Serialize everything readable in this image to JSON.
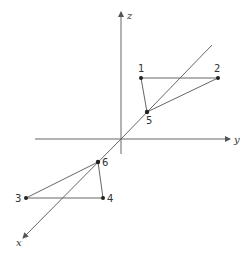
{
  "diagram": {
    "type": "3d-axes-points",
    "axes": [
      {
        "name": "x",
        "label": "x"
      },
      {
        "name": "y",
        "label": "y"
      },
      {
        "name": "z",
        "label": "z"
      }
    ],
    "points": [
      {
        "id": "1",
        "label": "1"
      },
      {
        "id": "2",
        "label": "2"
      },
      {
        "id": "3",
        "label": "3"
      },
      {
        "id": "4",
        "label": "4"
      },
      {
        "id": "5",
        "label": "5"
      },
      {
        "id": "6",
        "label": "6"
      }
    ],
    "colors": {
      "line": "#555555",
      "point": "#222222",
      "background": "#ffffff"
    }
  }
}
